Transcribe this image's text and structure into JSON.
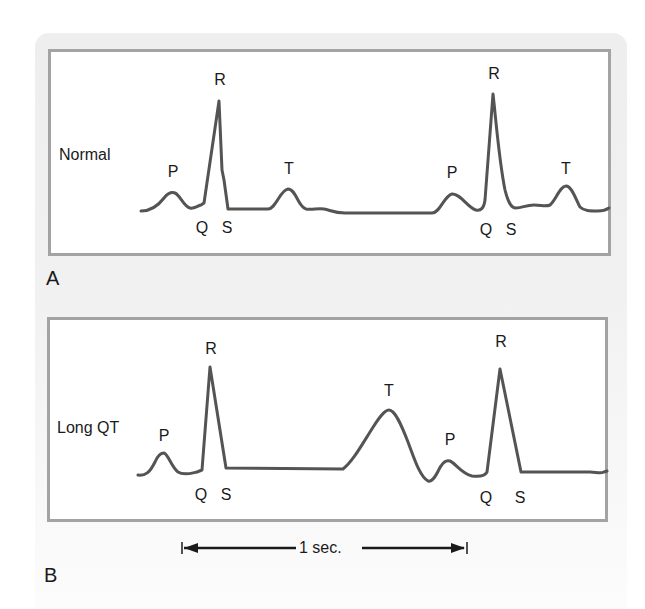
{
  "figure": {
    "colors": {
      "trace": "#545454",
      "frame": "#a3a3a3",
      "background_panel": "#eeeeee",
      "text": "#1a1a1a"
    },
    "panels": [
      {
        "letter": "A",
        "rhythm_label": "Normal",
        "wave_labels": [
          {
            "text": "P",
            "x": 173,
            "y": 164
          },
          {
            "text": "R",
            "x": 220,
            "y": 72
          },
          {
            "text": "Q",
            "x": 202,
            "y": 220
          },
          {
            "text": "S",
            "x": 227,
            "y": 220
          },
          {
            "text": "T",
            "x": 289,
            "y": 161
          },
          {
            "text": "P",
            "x": 452,
            "y": 165
          },
          {
            "text": "R",
            "x": 494,
            "y": 66
          },
          {
            "text": "Q",
            "x": 486,
            "y": 222
          },
          {
            "text": "S",
            "x": 511,
            "y": 222
          },
          {
            "text": "T",
            "x": 566,
            "y": 161
          }
        ]
      },
      {
        "letter": "B",
        "rhythm_label": "Long QT",
        "wave_labels": [
          {
            "text": "P",
            "x": 164,
            "y": 428
          },
          {
            "text": "R",
            "x": 211,
            "y": 341
          },
          {
            "text": "Q",
            "x": 201,
            "y": 487
          },
          {
            "text": "S",
            "x": 226,
            "y": 487
          },
          {
            "text": "T",
            "x": 389,
            "y": 383
          },
          {
            "text": "P",
            "x": 450,
            "y": 432
          },
          {
            "text": "R",
            "x": 501,
            "y": 334
          },
          {
            "text": "Q",
            "x": 486,
            "y": 490
          },
          {
            "text": "S",
            "x": 520,
            "y": 490
          }
        ]
      }
    ],
    "scale_bar": {
      "label": "1 sec.",
      "start_x": 182,
      "end_x": 467,
      "y": 548
    }
  }
}
